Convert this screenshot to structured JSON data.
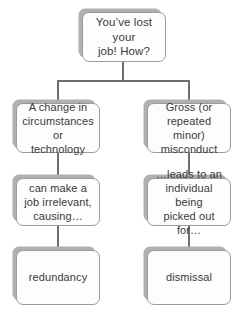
{
  "diagram": {
    "colors": {
      "background": "#ffffff",
      "node_fill": "#fdfdfd",
      "node_border": "#9b9b9b",
      "node_shadow": "#b0b0b0",
      "text": "#3a3a3a",
      "connector": "#6e6e6e"
    },
    "root": {
      "label": "You’ve lost your\njob! How?"
    },
    "branches": [
      {
        "side": "left",
        "cause": "A change in\ncircumstances or\ntechnology",
        "effect": "can make a\njob irrelevant,\ncausing…",
        "outcome": "redundancy"
      },
      {
        "side": "right",
        "cause": "Gross (or\nrepeated minor)\nmisconduct",
        "effect": "…leads to an\nindividual being\npicked out for…",
        "outcome": "dismissal"
      }
    ]
  }
}
